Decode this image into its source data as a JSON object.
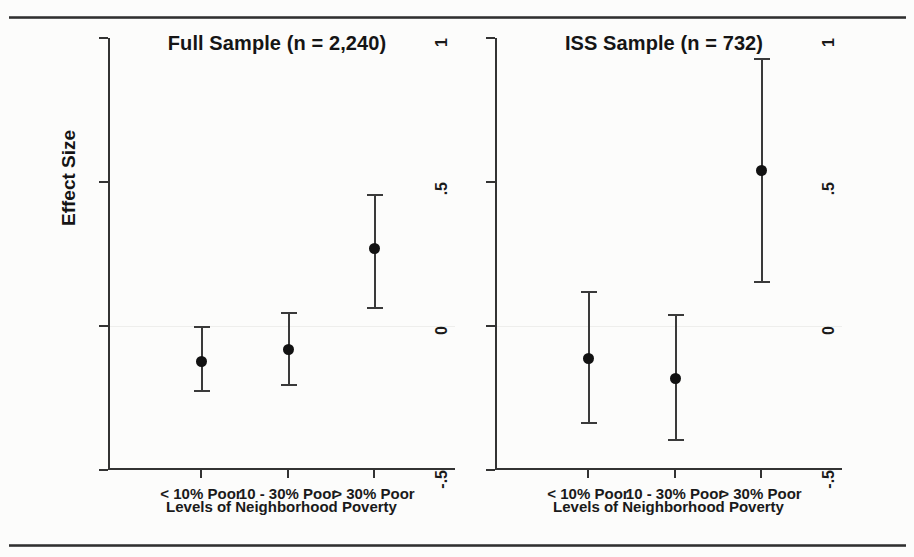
{
  "figure": {
    "background_color": "#fcfcfb",
    "ink_color": "#1d1d1d",
    "rule_color": "#2a2a2a"
  },
  "axis": {
    "ylabel": "Effect Size",
    "xlabel": "Levels of Neighborhood Poverty",
    "y_ticks": [
      {
        "label": "1",
        "value": 1
      },
      {
        "label": ".5",
        "value": 0.5
      },
      {
        "label": "0",
        "value": 0
      },
      {
        "label": "-.5",
        "value": -0.5
      }
    ],
    "x_ticks": [
      "< 10% Poor",
      "10 - 30% Poor",
      "> 30% Poor"
    ]
  },
  "panels": [
    {
      "title": "Full Sample (n = 2,240)"
    },
    {
      "title": "ISS Sample (n = 732)"
    }
  ],
  "chart_data": {
    "type": "scatter",
    "xlabel": "Levels of Neighborhood Poverty",
    "ylabel": "Effect Size",
    "ylim": [
      -0.5,
      1
    ],
    "yticks": [
      -0.5,
      0,
      0.5,
      1
    ],
    "ytick_labels": [
      "-.5",
      "0",
      ".5",
      "1"
    ],
    "categories": [
      "< 10% Poor",
      "10 - 30% Poor",
      "> 30% Poor"
    ],
    "grid": false,
    "legend": "none",
    "zero_reference_line": true,
    "panels": [
      {
        "name": "Full Sample (n = 2,240)",
        "n": 2240,
        "points": [
          {
            "category": "< 10% Poor",
            "estimate": -0.12,
            "ci_low": -0.23,
            "ci_high": 0.0
          },
          {
            "category": "10 - 30% Poor",
            "estimate": -0.08,
            "ci_low": -0.21,
            "ci_high": 0.05
          },
          {
            "category": "> 30% Poor",
            "estimate": 0.27,
            "ci_low": 0.06,
            "ci_high": 0.46
          }
        ]
      },
      {
        "name": "ISS Sample (n = 732)",
        "n": 732,
        "points": [
          {
            "category": "< 10% Poor",
            "estimate": -0.11,
            "ci_low": -0.34,
            "ci_high": 0.12
          },
          {
            "category": "10 - 30% Poor",
            "estimate": -0.18,
            "ci_low": -0.4,
            "ci_high": 0.04
          },
          {
            "category": "> 30% Poor",
            "estimate": 0.54,
            "ci_low": 0.15,
            "ci_high": 0.93
          }
        ]
      }
    ]
  }
}
